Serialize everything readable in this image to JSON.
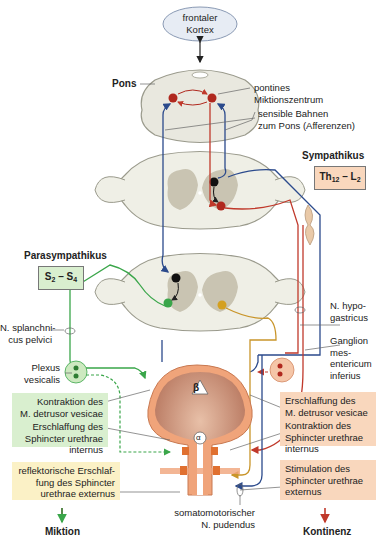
{
  "cortex": {
    "label_line1": "frontaler",
    "label_line2": "Kortex"
  },
  "pons": {
    "label": "Pons"
  },
  "labels": {
    "pontine_center_1": "pontines",
    "pontine_center_2": "Miktionszentrum",
    "afferent_1": "sensible Bahnen",
    "afferent_2": "zum Pons (Afferenzen)",
    "splanchnic_1": "N. splanchni-",
    "splanchnic_2": "cus pelvici",
    "plexus_1": "Plexus",
    "plexus_2": "vesicalis",
    "hypogastric_1": "N. hypo-",
    "hypogastric_2": "gastricus",
    "ganglion_1": "Ganglion",
    "ganglion_2": "mes-",
    "ganglion_3": "entericum",
    "ganglion_4": "inferius",
    "pudendal_1": "somatomotorischer",
    "pudendal_2": "N. pudendus",
    "beta": "β",
    "alpha": "α"
  },
  "sympathetic": {
    "title": "Sympathikus",
    "segment_main": "Th",
    "segment_sub1": "12",
    "segment_mid": " – L",
    "segment_sub2": "2"
  },
  "parasympathetic": {
    "title": "Parasympathikus",
    "segment_main": "S",
    "segment_sub1": "2",
    "segment_mid": " – S",
    "segment_sub2": "4"
  },
  "green_box": {
    "item1_l1": "Kontraktion des",
    "item1_l2": "M. detrusor vesicae",
    "item2_l1": "Erschlaffung des",
    "item2_l2": "Sphincter urethrae",
    "item2_l3": "internus"
  },
  "yellow_box": {
    "l1": "reflektorische Erschlaf-",
    "l2": "fung des Sphincter",
    "l3": "urethrae externus"
  },
  "orange_box": {
    "item1_l1": "Erschlaffung des",
    "item1_l2": "M. detrusor vesicae",
    "item2_l1": "Kontraktion des",
    "item2_l2": "Sphincter urethrae",
    "item2_l3": "internus"
  },
  "orange_box2": {
    "l1": "Stimulation des",
    "l2": "Sphincter urethrae",
    "l3": "externus"
  },
  "outcomes": {
    "left": "Miktion",
    "right": "Kontinenz"
  },
  "colors": {
    "parasympathetic": "#3aa64a",
    "sympathetic": "#c0392b",
    "afferent": "#2b4a8c",
    "somatic": "#d4a020",
    "green_box": "#d9efcf",
    "orange_box": "#f9d7bd",
    "yellow_box": "#fbf1c6"
  }
}
